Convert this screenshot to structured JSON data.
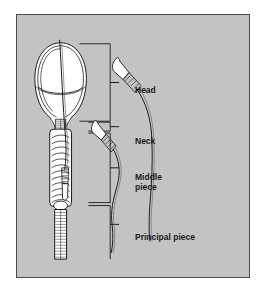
{
  "figure": {
    "panel": {
      "background_color": "#c3c3c3",
      "border_color": "#4a4a4a",
      "page_background": "#ffffff"
    }
  },
  "labels": {
    "head": "Head",
    "neck": "Neck",
    "middle_piece_line1": "Middle",
    "middle_piece_line2": "piece",
    "principal_piece": "Principal piece"
  },
  "bracket": {
    "segments": [
      {
        "name": "head",
        "label": "Head",
        "top_y": 43,
        "bottom_y": 121
      },
      {
        "name": "neck",
        "label": "Neck",
        "top_y": 122,
        "bottom_y": 131
      },
      {
        "name": "middle-piece",
        "label": "Middle piece",
        "top_y": 132,
        "bottom_y": 202
      },
      {
        "name": "principal-piece",
        "label": "Principal piece",
        "top_y": 206,
        "bottom_y": 258
      }
    ],
    "axis_x": 110,
    "tick_length": 9
  },
  "structures": {
    "main_sperm": {
      "name": "enlarged-sperm-cutaway",
      "parts": [
        "acrosome",
        "nucleus",
        "neck",
        "middle-piece-mitochondria",
        "principal-piece"
      ],
      "fill": "#ffffff",
      "stroke": "#1a1a1a"
    },
    "small_sperm": [
      {
        "name": "small-sperm-left",
        "head_x": 48,
        "head_y": 167,
        "orientation": "head-down"
      },
      {
        "name": "small-sperm-middle",
        "head_x": 82,
        "head_y": 112,
        "orientation": "head-up-left"
      },
      {
        "name": "small-sperm-right",
        "head_x": 104,
        "head_y": 50,
        "orientation": "head-up-left"
      }
    ]
  }
}
